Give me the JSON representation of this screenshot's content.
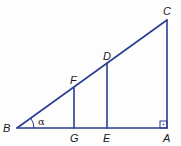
{
  "diagram": {
    "type": "right-triangle-similar-segments",
    "line_color": "#2a3d8f",
    "points": {
      "B": {
        "label": "B",
        "x": 17,
        "y": 128
      },
      "G": {
        "label": "G",
        "x": 74,
        "y": 128
      },
      "E": {
        "label": "E",
        "x": 107,
        "y": 128
      },
      "A": {
        "label": "A",
        "x": 167,
        "y": 128
      },
      "F": {
        "label": "F",
        "x": 74,
        "y": 88
      },
      "D": {
        "label": "D",
        "x": 107,
        "y": 63
      },
      "C": {
        "label": "C",
        "x": 167,
        "y": 20
      }
    },
    "angle_label": "α",
    "right_angle_marker": "·"
  }
}
